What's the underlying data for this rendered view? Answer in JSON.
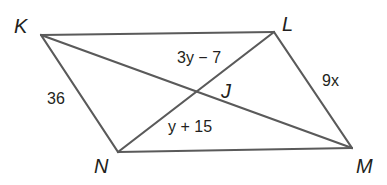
{
  "diagram": {
    "type": "parallelogram",
    "vertices": [
      {
        "name": "K",
        "x": 41,
        "y": 35,
        "label_x": 14,
        "label_y": 33
      },
      {
        "name": "L",
        "x": 274,
        "y": 32,
        "label_x": 282,
        "label_y": 31
      },
      {
        "name": "M",
        "x": 352,
        "y": 148,
        "label_x": 356,
        "label_y": 173
      },
      {
        "name": "N",
        "x": 118,
        "y": 152,
        "label_x": 94,
        "label_y": 173
      }
    ],
    "intersection": {
      "name": "J",
      "x": 197,
      "y": 92,
      "label_x": 222,
      "label_y": 98
    },
    "labels": {
      "K": "K",
      "L": "L",
      "M": "M",
      "N": "N",
      "J": "J",
      "side_KN": "36",
      "side_LM": "9x",
      "segment_LJ": "3y − 7",
      "segment_JN": "y + 15"
    }
  }
}
